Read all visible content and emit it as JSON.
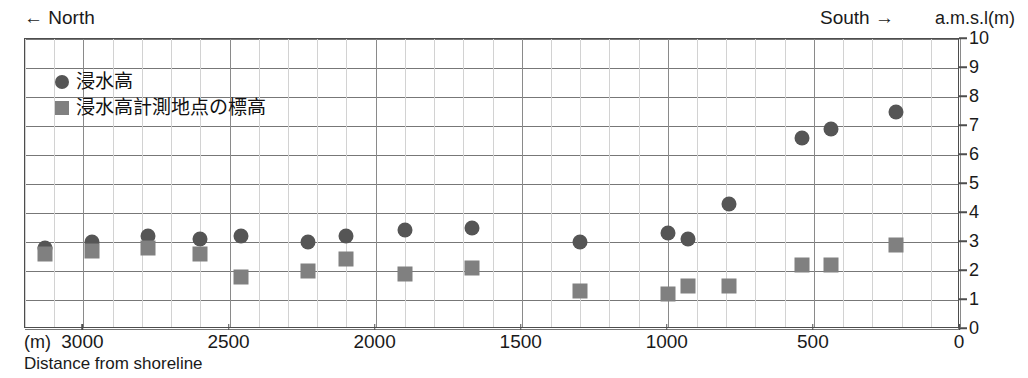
{
  "header": {
    "north_label": "← North",
    "south_label": "South →",
    "amsl_label": "a.m.s.l(m)"
  },
  "legend": {
    "items": [
      {
        "marker": "circle-marker",
        "label": "浸水高",
        "color": "#555555"
      },
      {
        "marker": "square-marker",
        "label": "浸水高計測地点の標高",
        "color": "#808080"
      }
    ]
  },
  "axes": {
    "x_unit_label": "(m)",
    "x_title": "Distance from shoreline",
    "x_ticks": [
      "3000",
      "2500",
      "2000",
      "1500",
      "1000",
      "500",
      "0"
    ],
    "y_ticks": [
      "10",
      "9",
      "8",
      "7",
      "6",
      "5",
      "4",
      "3",
      "2",
      "1",
      "0"
    ]
  },
  "chart_data": {
    "type": "scatter",
    "title": "",
    "xlabel": "Distance from shoreline (m)",
    "ylabel": "a.m.s.l(m)",
    "xlim": [
      3200,
      0
    ],
    "ylim": [
      0,
      10
    ],
    "x_inverted": true,
    "grid": true,
    "legend_position": "top-left",
    "x_ticks": [
      3000,
      2500,
      2000,
      1500,
      1000,
      500,
      0
    ],
    "y_ticks": [
      0,
      1,
      2,
      3,
      4,
      5,
      6,
      7,
      8,
      9,
      10
    ],
    "annotations": [
      "← North",
      "South →",
      "a.m.s.l(m)",
      "(m)",
      "Distance from shoreline"
    ],
    "series": [
      {
        "name": "浸水高",
        "marker": "circle",
        "color": "#555555",
        "points": [
          {
            "x": 3130,
            "y": 2.8
          },
          {
            "x": 2970,
            "y": 3.0
          },
          {
            "x": 2780,
            "y": 3.2
          },
          {
            "x": 2600,
            "y": 3.1
          },
          {
            "x": 2460,
            "y": 3.2
          },
          {
            "x": 2230,
            "y": 3.0
          },
          {
            "x": 2100,
            "y": 3.2
          },
          {
            "x": 1900,
            "y": 3.4
          },
          {
            "x": 1670,
            "y": 3.5
          },
          {
            "x": 1300,
            "y": 3.0
          },
          {
            "x": 1000,
            "y": 3.3
          },
          {
            "x": 930,
            "y": 3.1
          },
          {
            "x": 790,
            "y": 4.3
          },
          {
            "x": 540,
            "y": 6.6
          },
          {
            "x": 440,
            "y": 6.9
          },
          {
            "x": 220,
            "y": 7.5
          }
        ]
      },
      {
        "name": "浸水高計測地点の標高",
        "marker": "square",
        "color": "#808080",
        "points": [
          {
            "x": 3130,
            "y": 2.6
          },
          {
            "x": 2970,
            "y": 2.7
          },
          {
            "x": 2780,
            "y": 2.8
          },
          {
            "x": 2600,
            "y": 2.6
          },
          {
            "x": 2460,
            "y": 1.8
          },
          {
            "x": 2230,
            "y": 2.0
          },
          {
            "x": 2100,
            "y": 2.4
          },
          {
            "x": 1900,
            "y": 1.9
          },
          {
            "x": 1670,
            "y": 2.1
          },
          {
            "x": 1300,
            "y": 1.3
          },
          {
            "x": 1000,
            "y": 1.2
          },
          {
            "x": 930,
            "y": 1.5
          },
          {
            "x": 790,
            "y": 1.5
          },
          {
            "x": 540,
            "y": 2.2
          },
          {
            "x": 440,
            "y": 2.2
          },
          {
            "x": 220,
            "y": 2.9
          }
        ]
      }
    ]
  }
}
